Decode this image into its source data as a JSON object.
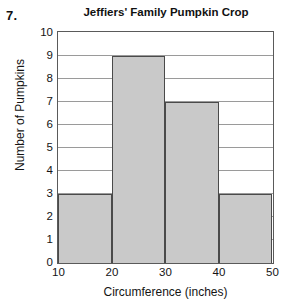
{
  "problem": {
    "number": "7."
  },
  "chart_data": {
    "type": "bar",
    "title": "Jeffiers' Family Pumpkin Crop",
    "xlabel": "Circumference (inches)",
    "ylabel": "Number of Pumpkins",
    "grid": true,
    "legend": false,
    "xlim": [
      10,
      50
    ],
    "ylim": [
      0,
      10
    ],
    "x_tick_labels": [
      "10",
      "20",
      "30",
      "40",
      "50"
    ],
    "y_tick_labels": [
      "0",
      "1",
      "2",
      "3",
      "4",
      "5",
      "6",
      "7",
      "8",
      "9",
      "10"
    ],
    "bin_edges": [
      10,
      20,
      30,
      40,
      50
    ],
    "categories": [
      "10-20",
      "20-30",
      "30-40",
      "40-50"
    ],
    "values": [
      3,
      9,
      7,
      3
    ],
    "bar_fill_color": "#c9c9c9",
    "bar_border_color": "#4a4a4a",
    "gridline_color": "#9a9a9a",
    "axis_color": "#5a5a5a"
  }
}
